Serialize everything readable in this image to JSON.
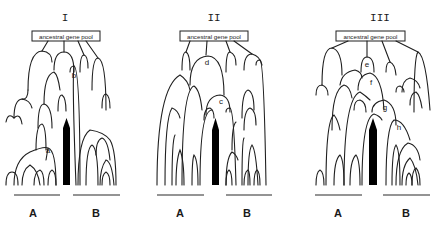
{
  "figure": {
    "panels": [
      {
        "id": "I",
        "title": "I",
        "root_label": "ancestral gene pool",
        "node_labels": [
          "a",
          "b"
        ],
        "group_labels": [
          "A",
          "B"
        ]
      },
      {
        "id": "II",
        "title": "II",
        "root_label": "ancestral gene pool",
        "node_labels": [
          "d",
          "c"
        ],
        "group_labels": [
          "A",
          "B"
        ]
      },
      {
        "id": "III",
        "title": "III",
        "root_label": "ancestral gene pool",
        "node_labels": [
          "e",
          "f",
          "g",
          "h"
        ],
        "group_labels": [
          "A",
          "B"
        ]
      }
    ],
    "colors": {
      "line": "#1f1f1f",
      "arrow": "#000000",
      "background": "#ffffff"
    }
  }
}
